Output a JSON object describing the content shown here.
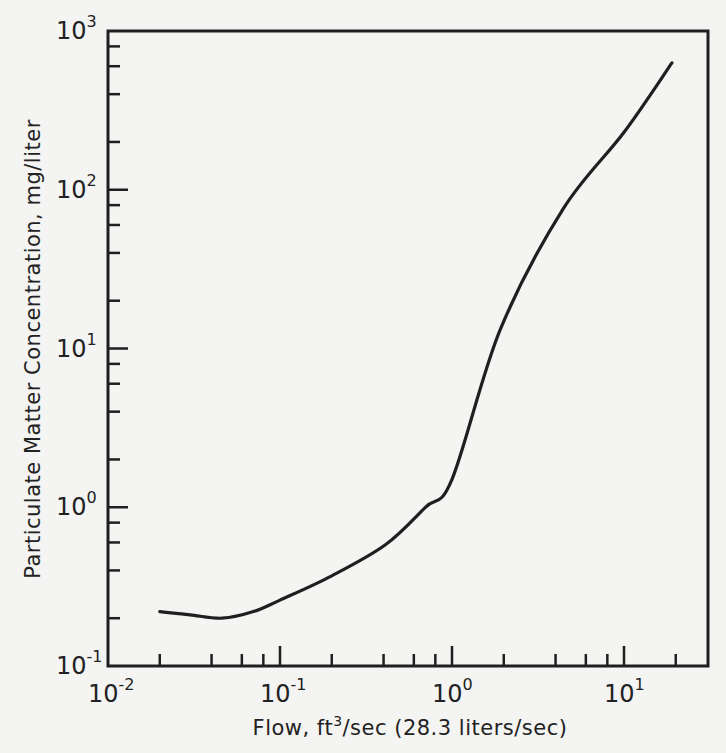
{
  "chart_data": {
    "type": "line",
    "title": "",
    "xlabel": "Flow, ft³/sec (28.3 liters/sec)",
    "ylabel": "Particulate Matter Concentration, mg/liter",
    "xscale": "log",
    "yscale": "log",
    "xlim": [
      0.01,
      31
    ],
    "ylim": [
      0.1,
      1000
    ],
    "grid": false,
    "legend": null,
    "x_ticks": [
      {
        "value": 0.01,
        "base": "10",
        "exp": "-2"
      },
      {
        "value": 0.1,
        "base": "10",
        "exp": "-1"
      },
      {
        "value": 1,
        "base": "10",
        "exp": "0"
      },
      {
        "value": 10,
        "base": "10",
        "exp": "1"
      }
    ],
    "y_ticks": [
      {
        "value": 0.1,
        "base": "10",
        "exp": "-1"
      },
      {
        "value": 1,
        "base": "10",
        "exp": "0"
      },
      {
        "value": 10,
        "base": "10",
        "exp": "1"
      },
      {
        "value": 100,
        "base": "10",
        "exp": "2"
      },
      {
        "value": 1000,
        "base": "10",
        "exp": "3"
      }
    ],
    "series": [
      {
        "name": "Particulate matter concentration vs flow",
        "x": [
          0.02,
          0.03,
          0.046,
          0.07,
          0.1,
          0.2,
          0.41,
          0.7,
          1.0,
          1.9,
          4.4,
          10,
          19
        ],
        "y": [
          0.22,
          0.21,
          0.2,
          0.22,
          0.26,
          0.37,
          0.58,
          1.0,
          1.5,
          13,
          75,
          230,
          630
        ]
      }
    ]
  },
  "x_axis": {
    "label_main": "Flow, ft",
    "label_sup": "3",
    "label_rest": "/sec (28.3 liters/sec)"
  },
  "y_axis": {
    "label": "Particulate Matter Concentration, mg/liter"
  },
  "colors": {
    "ink": "#1f1f1f",
    "paper": "#f4f4f2"
  }
}
